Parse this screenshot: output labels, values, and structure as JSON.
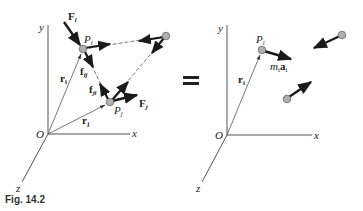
{
  "figure": {
    "caption": "Fig. 14.2",
    "equals_sign": "="
  },
  "left_diagram": {
    "axes": {
      "x": "x",
      "y": "y",
      "z": "z",
      "origin": "O"
    },
    "particles": [
      {
        "id": "Pi",
        "label": "P",
        "sub": "i"
      },
      {
        "id": "Pj",
        "label": "P",
        "sub": "j"
      },
      {
        "id": "Pk",
        "label": ""
      }
    ],
    "vectors": {
      "external_force_i": {
        "label": "F",
        "sub": "i"
      },
      "external_force_j": {
        "label": "F",
        "sub": "j"
      },
      "internal_force_ij": {
        "label": "f",
        "sub": "ij"
      },
      "internal_force_ji": {
        "label": "f",
        "sub": "ji"
      },
      "position_i": {
        "label": "r",
        "sub": "i"
      },
      "position_j": {
        "label": "r",
        "sub": "j"
      }
    }
  },
  "right_diagram": {
    "axes": {
      "x": "x",
      "y": "y",
      "z": "z",
      "origin": "O"
    },
    "particles": [
      {
        "id": "Pi",
        "label": "P",
        "sub": "i"
      }
    ],
    "vectors": {
      "inertia_i": {
        "label_m": "m",
        "sub_m": "i",
        "label_a": "a",
        "sub_a": "i"
      },
      "position_i": {
        "label": "r",
        "sub": "i"
      }
    }
  },
  "colors": {
    "line": "#333333",
    "particle_fill": "#b0b0b0",
    "particle_stroke": "#666666",
    "arrow": "#1a1a1a"
  }
}
